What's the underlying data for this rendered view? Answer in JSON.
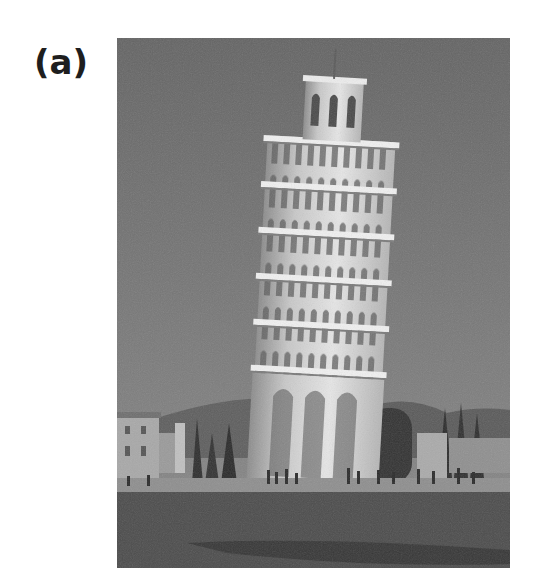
{
  "figure": {
    "label": "(a)",
    "image": {
      "subject": "Leaning Tower of Pisa",
      "style": "grayscale photograph",
      "sky_color": "#6d6d6d",
      "tower_color": "#d9d9d9",
      "ground_color": "#4e4e4e"
    }
  }
}
